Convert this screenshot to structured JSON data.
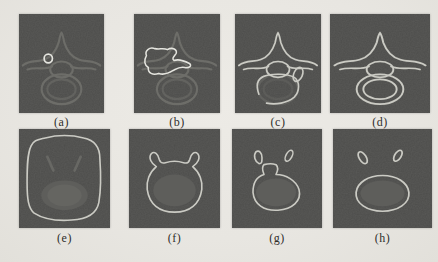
{
  "figure": {
    "name": "eight-panel-vertebra-contour-figure",
    "colors": {
      "page_bg": "#e8e6e1",
      "panel_bg": "#4d4d4b",
      "faint_edge": "#74746f",
      "faint_fill": "#5e5e5b",
      "faint_fill_light": "#666663",
      "contour": "#cbcbc4",
      "contour_bright": "#e4e4de",
      "label_text": "#2f2e2b"
    },
    "panels": [
      {
        "id": "a",
        "label": "(a)",
        "image": "vertebra-axial-slice-faint-edges-with-small-initial-circle-contour"
      },
      {
        "id": "b",
        "label": "(b)",
        "image": "vertebra-axial-slice-faint-edges-with-growing-blob-contour"
      },
      {
        "id": "c",
        "label": "(c)",
        "image": "vertebra-axial-slice-bright-contour-nearly-converged-open-body-ring"
      },
      {
        "id": "d",
        "label": "(d)",
        "image": "vertebra-axial-slice-bright-contour-fully-converged"
      },
      {
        "id": "e",
        "label": "(e)",
        "image": "vertebra-body-slice-large-rounded-box-contour"
      },
      {
        "id": "f",
        "label": "(f)",
        "image": "vertebra-body-slice-contour-hugging-body-and-pedicle-horns"
      },
      {
        "id": "g",
        "label": "(g)",
        "image": "vertebra-body-slice-contour-splitting-from-pedicles"
      },
      {
        "id": "h",
        "label": "(h)",
        "image": "vertebra-body-slice-final-contours-body-and-two-separate-pedicles"
      }
    ]
  }
}
